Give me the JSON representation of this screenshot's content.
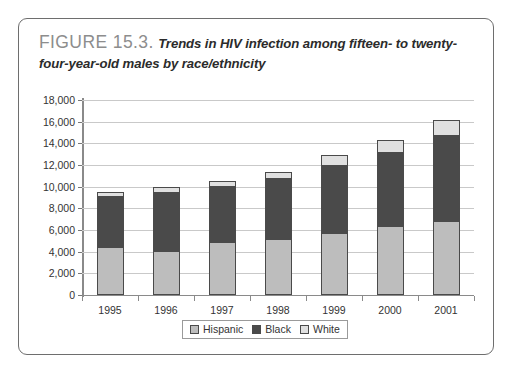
{
  "figure": {
    "label": "FIGURE 15.3.",
    "caption": "Trends in HIV infection among fifteen- to twenty-four-year-old males by race/ethnicity"
  },
  "chart_data": {
    "type": "bar",
    "stacked": true,
    "title": "Trends in HIV infection among fifteen- to twenty-four-year-old males by race/ethnicity",
    "xlabel": "",
    "ylabel": "",
    "categories": [
      "1995",
      "1996",
      "1997",
      "1998",
      "1999",
      "2000",
      "2001"
    ],
    "series": [
      {
        "name": "Hispanic",
        "color": "#bdbdbd",
        "values": [
          4450,
          4100,
          4900,
          5200,
          5700,
          6400,
          6800
        ]
      },
      {
        "name": "Black",
        "color": "#4a4a4a",
        "values": [
          4700,
          5450,
          5200,
          5600,
          6300,
          6800,
          8000
        ]
      },
      {
        "name": "White",
        "color": "#e0e0e0",
        "values": [
          400,
          450,
          450,
          600,
          900,
          1100,
          1400
        ]
      }
    ],
    "totals": [
      9550,
      10000,
      10550,
      11400,
      12900,
      14300,
      16200
    ],
    "ylim": [
      0,
      18000
    ],
    "ytick_values": [
      0,
      2000,
      4000,
      6000,
      8000,
      10000,
      12000,
      14000,
      16000,
      18000
    ],
    "ytick_labels": [
      "0",
      "2,000",
      "4,000",
      "6,000",
      "8,000",
      "10,000",
      "12,000",
      "14,000",
      "16,000",
      "18,000"
    ],
    "grid": true,
    "legend_position": "bottom",
    "legend_entries": [
      "Hispanic",
      "Black",
      "White"
    ]
  },
  "colors": {
    "hispanic": "#bdbdbd",
    "black": "#4a4a4a",
    "white": "#e0e0e0",
    "gridline": "#c9c9c9",
    "axis": "#8a8a8a",
    "frame": "#6e6e6e"
  }
}
